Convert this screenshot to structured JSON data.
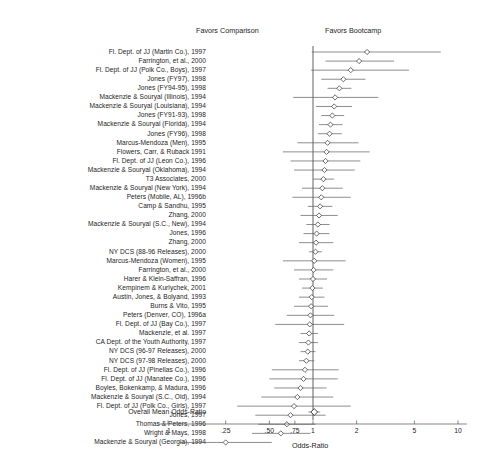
{
  "chart_data": {
    "type": "forest",
    "title": "",
    "xlabel": "Odds-Ratio",
    "xscale": "log",
    "xlim": [
      0.085,
      11.5
    ],
    "ticks": [
      ".1",
      ".25",
      ".50",
      ".75",
      "1",
      "2",
      "5",
      "10"
    ],
    "tick_values": [
      0.1,
      0.25,
      0.5,
      0.75,
      1,
      2,
      5,
      10
    ],
    "reference_line": 1.0,
    "grid": false,
    "left_annotation": "Favors Comparison",
    "right_annotation": "Favors Bootcamp",
    "summary_label": "Overall Mean Odds-Ratio",
    "summary": {
      "or": 1.02,
      "lo": 0.93,
      "hi": 1.12
    },
    "categories": [
      "Fl. Dept. of JJ (Martin Co.), 1997",
      "Farrington, et al., 2000",
      "Fl. Dept. of JJ (Polk Co., Boys), 1997",
      "Jones (FY97), 1998",
      "Jones (FY94-95), 1998",
      "Mackenzie & Souryal (Illinois), 1994",
      "Mackenzie & Souryal (Louisiana), 1994",
      "Jones (FY91-93), 1998",
      "Mackenzie & Souryal (Florida), 1994",
      "Jones (FY96), 1998",
      "Marcus-Mendoza (Men), 1995",
      "Flowers, Carr, & Ruback 1991",
      "Fl. Dept. of JJ (Leon Co.), 1996",
      "Mackenzie & Souryal (Oklahoma), 1994",
      "T3 Associates, 2000",
      "Mackenzie & Souryal (New York), 1994",
      "Peters (Mobile, AL), 1996b",
      "Camp & Sandhu, 1995",
      "Zhang, 2000",
      "Mackenzie & Souryal (S.C., New), 1994",
      "Jones, 1996",
      "Zhang, 2000",
      "NY DCS (88-96 Releases), 2000",
      "Marcus-Mendoza (Women), 1995",
      "Farrington, et al., 2000",
      "Harer & Klein-Saffran, 1996",
      "Kempinem & Kurlychek, 2001",
      "Austin, Jones, & Bolyand, 1993",
      "Burns & Vito, 1995",
      "Peters (Denver, CO), 1996a",
      "Fl. Dept. of JJ (Bay Co.), 1997",
      "Mackenzie, et al. 1997",
      "CA Dept. of the Youth Authority, 1997",
      "NY DCS (96-97 Releases), 2000",
      "NY DCS (97-98 Releases), 2000",
      "Fl. Dept. of JJ (Pinellas Co.), 1996",
      "Fl. Dept. of JJ (Manatee Co.), 1996",
      "Boyles, Bokenkamp, & Madura, 1996",
      "Mackenzie & Souryal (S.C., Old), 1994",
      "Fl. Dept. of JJ (Polk Co., Girls), 1997",
      "Jones, 1997",
      "Thomas & Peters, 1996",
      "Wright & Mays, 1998",
      "Mackenzie & Souryal (Georgia), 1994"
    ],
    "points": [
      {
        "or": 2.36,
        "lo": 0.98,
        "hi": 7.6
      },
      {
        "or": 2.08,
        "lo": 1.22,
        "hi": 3.62
      },
      {
        "or": 1.82,
        "lo": 0.97,
        "hi": 4.6
      },
      {
        "or": 1.62,
        "lo": 1.14,
        "hi": 2.3
      },
      {
        "or": 1.52,
        "lo": 1.26,
        "hi": 1.84
      },
      {
        "or": 1.42,
        "lo": 0.73,
        "hi": 2.82
      },
      {
        "or": 1.4,
        "lo": 1.05,
        "hi": 1.86
      },
      {
        "or": 1.36,
        "lo": 1.14,
        "hi": 1.64
      },
      {
        "or": 1.32,
        "lo": 1.1,
        "hi": 1.6
      },
      {
        "or": 1.3,
        "lo": 1.08,
        "hi": 1.58
      },
      {
        "or": 1.26,
        "lo": 0.78,
        "hi": 2.06
      },
      {
        "or": 1.24,
        "lo": 0.62,
        "hi": 2.46
      },
      {
        "or": 1.22,
        "lo": 0.7,
        "hi": 2.12
      },
      {
        "or": 1.2,
        "lo": 0.74,
        "hi": 1.94
      },
      {
        "or": 1.18,
        "lo": 1.0,
        "hi": 1.4
      },
      {
        "or": 1.16,
        "lo": 0.84,
        "hi": 1.6
      },
      {
        "or": 1.14,
        "lo": 0.72,
        "hi": 1.82
      },
      {
        "or": 1.12,
        "lo": 0.92,
        "hi": 1.36
      },
      {
        "or": 1.1,
        "lo": 0.82,
        "hi": 1.48
      },
      {
        "or": 1.08,
        "lo": 0.9,
        "hi": 1.3
      },
      {
        "or": 1.06,
        "lo": 0.86,
        "hi": 1.3
      },
      {
        "or": 1.05,
        "lo": 0.8,
        "hi": 1.38
      },
      {
        "or": 1.04,
        "lo": 0.94,
        "hi": 1.15
      },
      {
        "or": 1.02,
        "lo": 0.62,
        "hi": 1.68
      },
      {
        "or": 1.01,
        "lo": 0.74,
        "hi": 1.38
      },
      {
        "or": 1.0,
        "lo": 0.8,
        "hi": 1.25
      },
      {
        "or": 0.99,
        "lo": 0.84,
        "hi": 1.17
      },
      {
        "or": 0.98,
        "lo": 0.8,
        "hi": 1.2
      },
      {
        "or": 0.97,
        "lo": 0.74,
        "hi": 1.27
      },
      {
        "or": 0.96,
        "lo": 0.66,
        "hi": 1.4
      },
      {
        "or": 0.95,
        "lo": 0.55,
        "hi": 1.64
      },
      {
        "or": 0.94,
        "lo": 0.82,
        "hi": 1.08
      },
      {
        "or": 0.93,
        "lo": 0.8,
        "hi": 1.08
      },
      {
        "or": 0.92,
        "lo": 0.82,
        "hi": 1.04
      },
      {
        "or": 0.9,
        "lo": 0.8,
        "hi": 1.02
      },
      {
        "or": 0.88,
        "lo": 0.52,
        "hi": 1.5
      },
      {
        "or": 0.86,
        "lo": 0.5,
        "hi": 1.48
      },
      {
        "or": 0.82,
        "lo": 0.54,
        "hi": 1.24
      },
      {
        "or": 0.78,
        "lo": 0.44,
        "hi": 1.38
      },
      {
        "or": 0.74,
        "lo": 0.3,
        "hi": 1.82
      },
      {
        "or": 0.7,
        "lo": 0.4,
        "hi": 1.22
      },
      {
        "or": 0.66,
        "lo": 0.42,
        "hi": 1.04
      },
      {
        "or": 0.6,
        "lo": 0.38,
        "hi": 0.96
      },
      {
        "or": 0.25,
        "lo": 0.12,
        "hi": 0.52
      }
    ]
  }
}
